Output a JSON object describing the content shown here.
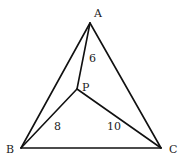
{
  "figure": {
    "width": 186,
    "height": 161,
    "stroke_color": "#111111",
    "stroke_width": 1.6
  },
  "points": {
    "A": {
      "label": "A",
      "x": 90,
      "y": 23,
      "label_x": 94,
      "label_y": 17
    },
    "B": {
      "label": "B",
      "x": 21,
      "y": 148,
      "label_x": 6,
      "label_y": 153
    },
    "C": {
      "label": "C",
      "x": 161,
      "y": 148,
      "label_x": 169,
      "label_y": 153
    },
    "P": {
      "label": "P",
      "x": 77,
      "y": 89,
      "label_x": 82,
      "label_y": 91
    }
  },
  "segments": [
    {
      "name": "AB",
      "from": "A",
      "to": "B"
    },
    {
      "name": "BC",
      "from": "B",
      "to": "C"
    },
    {
      "name": "CA",
      "from": "C",
      "to": "A"
    },
    {
      "name": "PA",
      "from": "P",
      "to": "A",
      "length_label": "6",
      "label_x": 89,
      "label_y": 62
    },
    {
      "name": "PB",
      "from": "P",
      "to": "B",
      "length_label": "8",
      "label_x": 54,
      "label_y": 130
    },
    {
      "name": "PC",
      "from": "P",
      "to": "C",
      "length_label": "10",
      "label_x": 107,
      "label_y": 130
    }
  ]
}
